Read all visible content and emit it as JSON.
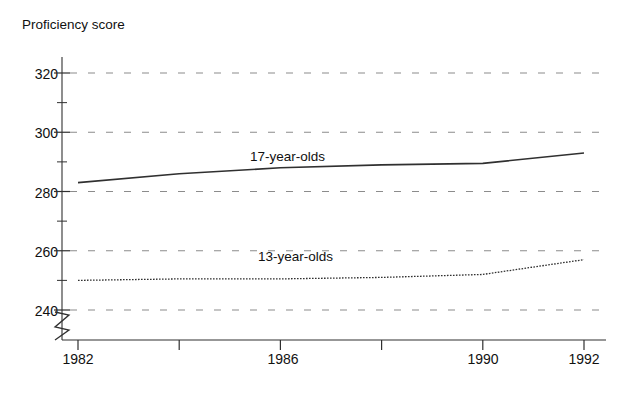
{
  "chart_data": {
    "type": "line",
    "title": "",
    "subtitle": "",
    "xlabel": "Year",
    "ylabel": "Proficiency score",
    "x": [
      1982,
      1984,
      1986,
      1988,
      1990,
      1992
    ],
    "xlim": [
      1982,
      1992
    ],
    "ylim": [
      240,
      330
    ],
    "y_axis_break": true,
    "y_axis_break_note": "axis broken below 240",
    "grid": true,
    "grid_style": "dashed-horizontal",
    "legend_position": "inline-annotation",
    "series": [
      {
        "name": "17-year-olds",
        "line_style": "solid",
        "values": [
          283,
          286,
          288,
          289,
          289.5,
          293
        ]
      },
      {
        "name": "13-year-olds",
        "line_style": "dotted",
        "values": [
          250,
          250.5,
          250.5,
          251,
          252,
          257
        ]
      }
    ],
    "y_major_ticks": [
      240,
      260,
      280,
      300,
      320
    ],
    "y_major_tick_labels": [
      "240",
      "260",
      "280",
      "300",
      "320"
    ],
    "y_minor_ticks": [
      250,
      270,
      290,
      310,
      330
    ],
    "x_major_ticks": [
      1982,
      1984,
      1986,
      1988,
      1990,
      1992
    ],
    "x_tick_labels": [
      {
        "value": 1982,
        "label": "1982"
      },
      {
        "value": 1984,
        "label": ""
      },
      {
        "value": 1986,
        "label": "1986"
      },
      {
        "value": 1988,
        "label": ""
      },
      {
        "value": 1990,
        "label": "1990"
      },
      {
        "value": 1992,
        "label": "1992"
      }
    ],
    "annotations": [
      {
        "text": "17-year-olds",
        "x": 1986.6,
        "y": 296.5
      },
      {
        "text": "13-year-olds",
        "x": 1987.0,
        "y": 259.0
      }
    ],
    "colors": {
      "line": "#303030",
      "axis": "#303030",
      "grid": "#8c8c8c",
      "text": "#111111",
      "background": "#ffffff"
    }
  }
}
